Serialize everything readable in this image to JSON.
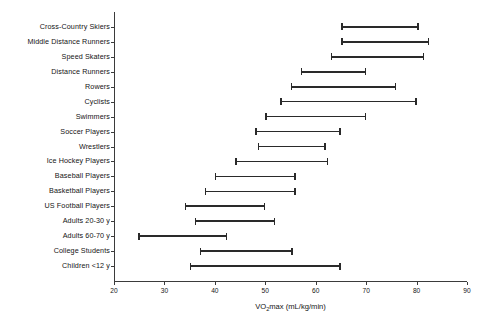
{
  "chart_data": {
    "type": "bar",
    "subtype": "range-bar-horizontal",
    "title": "",
    "xlabel": "VO2max (mL/kg/min)",
    "xlabel_parts": {
      "pre": "VO",
      "sub": "2",
      "post": "max (mL/kg/min)"
    },
    "ylabel": "",
    "xlim": [
      20,
      90
    ],
    "xticks": [
      20,
      30,
      40,
      50,
      60,
      70,
      80,
      90
    ],
    "xtick_labels": [
      "20",
      "30",
      "40",
      "50",
      "60",
      "70",
      "80",
      "90"
    ],
    "grid": false,
    "legend": false,
    "orientation": "horizontal",
    "categories": [
      "Cross-Country Skiers",
      "Middle Distance Runners",
      "Speed Skaters",
      "Distance Runners",
      "Rowers",
      "Cyclists",
      "Swimmers",
      "Soccer Players",
      "Wrestlers",
      "Ice Hockey Players",
      "Baseball Players",
      "Basketball Players",
      "US Football Players",
      "Adults 20-30 y",
      "Adults 60-70 y",
      "College Students",
      "Children <12 y"
    ],
    "ranges": [
      {
        "category": "Cross-Country Skiers",
        "low": 65,
        "high": 80.5
      },
      {
        "category": "Middle Distance Runners",
        "low": 65,
        "high": 82.5
      },
      {
        "category": "Speed Skaters",
        "low": 63,
        "high": 81.5
      },
      {
        "category": "Distance Runners",
        "low": 57,
        "high": 70
      },
      {
        "category": "Rowers",
        "low": 55,
        "high": 76
      },
      {
        "category": "Cyclists",
        "low": 53,
        "high": 80
      },
      {
        "category": "Swimmers",
        "low": 50,
        "high": 70
      },
      {
        "category": "Soccer Players",
        "low": 48,
        "high": 65
      },
      {
        "category": "Wrestlers",
        "low": 48.5,
        "high": 62
      },
      {
        "category": "Ice Hockey Players",
        "low": 44,
        "high": 62.5
      },
      {
        "category": "Baseball Players",
        "low": 40,
        "high": 56
      },
      {
        "category": "Basketball Players",
        "low": 38,
        "high": 56
      },
      {
        "category": "US Football Players",
        "low": 34,
        "high": 50
      },
      {
        "category": "Adults 20-30 y",
        "low": 36,
        "high": 52
      },
      {
        "category": "Adults 60-70 y",
        "low": 24.8,
        "high": 42.5
      },
      {
        "category": "College Students",
        "low": 37,
        "high": 55.5
      },
      {
        "category": "Children <12 y",
        "low": 35,
        "high": 65
      }
    ],
    "colors": {
      "bar": "#2a2a2a",
      "axis": "#3b3b3b",
      "text": "#141414",
      "background": "#ffffff"
    }
  }
}
